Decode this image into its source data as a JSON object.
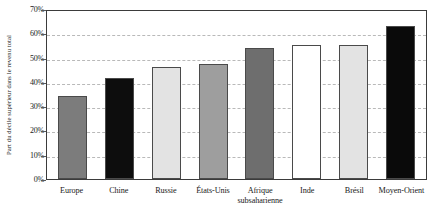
{
  "chart_data": {
    "type": "bar",
    "title": "",
    "subtitle": "",
    "xlabel": "",
    "ylabel": "Part du décile supérieur dans le revenu total",
    "ylim": [
      0,
      70
    ],
    "yticks": [
      0,
      10,
      20,
      30,
      40,
      50,
      60,
      70
    ],
    "ytick_labels": [
      "0%",
      "10%",
      "20%",
      "30%",
      "40%",
      "50%",
      "60%",
      "70%"
    ],
    "grid": true,
    "legend": "none",
    "unit": "%",
    "categories": [
      "Europe",
      "Chine",
      "Russie",
      "États-Unis",
      "Afrique subsaharienne",
      "Inde",
      "Brésil",
      "Moyen-Orient"
    ],
    "values": [
      34,
      41.5,
      46,
      47.5,
      54,
      55,
      55,
      63
    ],
    "bar_colors": [
      "#7c7c7c",
      "#0d0d0d",
      "#e3e3e3",
      "#9e9e9e",
      "#6e6e6e",
      "#ffffff",
      "#e3e3e3",
      "#0a0a0a"
    ],
    "bar_border_color": "#4a4a4a",
    "gridline_color": "#b9b9b9",
    "axis_color": "#3b3b3b",
    "background_color": "#ffffff"
  },
  "x_axis": {
    "labels": [
      {
        "line1": "Europe",
        "line2": ""
      },
      {
        "line1": "Chine",
        "line2": ""
      },
      {
        "line1": "Russie",
        "line2": ""
      },
      {
        "line1": "États-Unis",
        "line2": ""
      },
      {
        "line1": "Afrique",
        "line2": "subsaharienne"
      },
      {
        "line1": "Inde",
        "line2": ""
      },
      {
        "line1": "Brésil",
        "line2": ""
      },
      {
        "line1": "Moyen-Orient",
        "line2": ""
      }
    ]
  },
  "y_axis": {
    "title": "Part du décile supérieur dans le revenu total",
    "ticks": [
      {
        "label": "70%",
        "value": 70
      },
      {
        "label": "60%",
        "value": 60
      },
      {
        "label": "50%",
        "value": 50
      },
      {
        "label": "40%",
        "value": 40
      },
      {
        "label": "30%",
        "value": 30
      },
      {
        "label": "20%",
        "value": 20
      },
      {
        "label": "10%",
        "value": 10
      },
      {
        "label": "0%",
        "value": 0
      }
    ]
  }
}
